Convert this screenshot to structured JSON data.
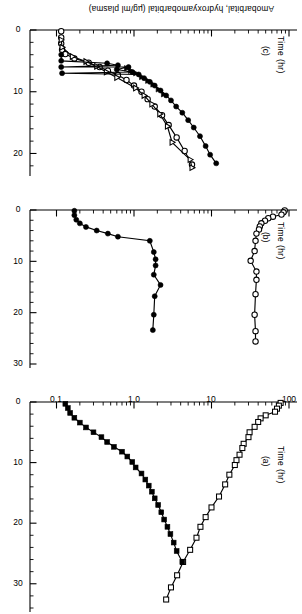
{
  "figure": {
    "orientation_deg": 180,
    "yaxis": {
      "label": "Amobarbital, hydroxyamobarbital (µg/ml plasma)",
      "scale": "log",
      "ticks": [
        "100",
        "10",
        "1.0",
        "0.1"
      ],
      "tick_values": [
        100,
        10,
        1,
        0.1
      ]
    },
    "panels": [
      {
        "id": "a",
        "panel_label": "(a)",
        "xlabel": "Time (hr)",
        "xticks": [
          "0",
          "10",
          "20",
          "30"
        ],
        "xtick_values": [
          0,
          10,
          20,
          30
        ],
        "xlim": [
          0,
          34
        ]
      },
      {
        "id": "b",
        "panel_label": "(b)",
        "xlabel": "Time (hr)",
        "xticks": [
          "0",
          "10",
          "20",
          "30"
        ],
        "xtick_values": [
          0,
          10,
          20,
          30
        ],
        "xlim": [
          0,
          30
        ]
      },
      {
        "id": "c",
        "panel_label": "(c)",
        "xlabel": "Time (hr)",
        "xticks": [
          "0",
          "10",
          "20"
        ],
        "xtick_values": [
          0,
          10,
          20
        ],
        "xlim": [
          0,
          23
        ]
      }
    ]
  },
  "chart_data": [
    {
      "type": "scatter",
      "panel": "a",
      "title": "(a)",
      "xlabel": "Time (hr)",
      "ylabel": "Amobarbital, hydroxyamobarbital (µg/ml plasma)",
      "yscale": "log",
      "xlim": [
        0,
        34
      ],
      "ylim": [
        0.1,
        100
      ],
      "grid": false,
      "series": [
        {
          "name": "amobarbital",
          "marker": "open-square",
          "points": [
            [
              0.15,
              78
            ],
            [
              0.6,
              74
            ],
            [
              1.1,
              70
            ],
            [
              1.6,
              66
            ],
            [
              2.2,
              50
            ],
            [
              2.7,
              43
            ],
            [
              3.3,
              40
            ],
            [
              4.1,
              36
            ],
            [
              5.0,
              31
            ],
            [
              5.8,
              30
            ],
            [
              6.9,
              26
            ],
            [
              7.6,
              25
            ],
            [
              8.7,
              23
            ],
            [
              9.6,
              21
            ],
            [
              10.4,
              20
            ],
            [
              12.0,
              17
            ],
            [
              13.6,
              15
            ],
            [
              15.6,
              12.5
            ],
            [
              17.4,
              10.0
            ],
            [
              19.0,
              8.4
            ],
            [
              20.6,
              7.2
            ],
            [
              22.4,
              6.4
            ],
            [
              24.4,
              5.3
            ],
            [
              26.4,
              4.3
            ],
            [
              28.6,
              3.6
            ],
            [
              30.6,
              3.0
            ],
            [
              32.6,
              2.6
            ]
          ]
        },
        {
          "name": "hydroxyamobarbital",
          "marker": "filled-square",
          "points": [
            [
              0.3,
              0.13
            ],
            [
              1.0,
              0.14
            ],
            [
              1.8,
              0.15
            ],
            [
              2.6,
              0.17
            ],
            [
              3.4,
              0.2
            ],
            [
              4.2,
              0.24
            ],
            [
              5.0,
              0.3
            ],
            [
              5.8,
              0.38
            ],
            [
              6.6,
              0.45
            ],
            [
              7.4,
              0.55
            ],
            [
              8.2,
              0.7
            ],
            [
              9.0,
              0.82
            ],
            [
              9.9,
              0.95
            ],
            [
              10.8,
              1.05
            ],
            [
              11.8,
              1.25
            ],
            [
              12.8,
              1.4
            ],
            [
              13.8,
              1.55
            ],
            [
              14.8,
              1.7
            ],
            [
              15.9,
              1.85
            ],
            [
              17.0,
              2.05
            ],
            [
              18.2,
              2.25
            ],
            [
              19.4,
              2.45
            ],
            [
              20.6,
              2.7
            ],
            [
              21.8,
              2.95
            ],
            [
              23.2,
              3.25
            ],
            [
              24.6,
              3.55
            ],
            [
              26.4,
              4.2
            ]
          ]
        }
      ]
    },
    {
      "type": "scatter",
      "panel": "b",
      "title": "(b)",
      "xlabel": "Time (hr)",
      "ylabel": "Amobarbital, hydroxyamobarbital (µg/ml plasma)",
      "yscale": "log",
      "xlim": [
        0,
        30
      ],
      "ylim": [
        0.1,
        100
      ],
      "grid": false,
      "series": [
        {
          "name": "amobarbital",
          "marker": "open-circle",
          "points": [
            [
              0.1,
              88
            ],
            [
              0.45,
              85
            ],
            [
              0.9,
              80
            ],
            [
              1.3,
              62
            ],
            [
              1.6,
              54
            ],
            [
              2.1,
              49
            ],
            [
              2.6,
              44
            ],
            [
              3.2,
              42
            ],
            [
              3.8,
              41
            ],
            [
              4.6,
              38
            ],
            [
              6.0,
              37
            ],
            [
              8.0,
              36
            ],
            [
              9.9,
              32
            ],
            [
              12.0,
              38
            ],
            [
              13.6,
              38
            ],
            [
              16.4,
              37
            ],
            [
              20.4,
              36
            ],
            [
              23.6,
              37
            ],
            [
              25.6,
              37
            ]
          ]
        },
        {
          "name": "hydroxyamobarbital",
          "marker": "filled-circle",
          "points": [
            [
              0.15,
              0.17
            ],
            [
              1.0,
              0.17
            ],
            [
              1.9,
              0.18
            ],
            [
              2.6,
              0.2
            ],
            [
              3.3,
              0.24
            ],
            [
              4.0,
              0.33
            ],
            [
              4.6,
              0.46
            ],
            [
              5.2,
              0.62
            ],
            [
              6.0,
              1.6
            ],
            [
              8.2,
              1.8
            ],
            [
              9.6,
              1.9
            ],
            [
              10.8,
              1.9
            ],
            [
              12.6,
              1.8
            ],
            [
              14.6,
              2.2
            ],
            [
              16.8,
              1.85
            ],
            [
              20.4,
              1.8
            ],
            [
              23.4,
              1.75
            ]
          ]
        }
      ]
    },
    {
      "type": "scatter",
      "panel": "c",
      "title": "(c)",
      "xlabel": "Time (hr)",
      "ylabel": "Amobarbital, hydroxyamobarbital (µg/ml plasma)",
      "yscale": "log",
      "xlim": [
        0,
        23
      ],
      "ylim": [
        0.1,
        100
      ],
      "grid": false,
      "series": [
        {
          "name": "amobarbital-open-circle",
          "marker": "open-circle",
          "points": [
            [
              0.2,
              0.115
            ],
            [
              1.2,
              0.115
            ],
            [
              2.2,
              0.115
            ],
            [
              3.2,
              0.118
            ],
            [
              3.9,
              0.13
            ],
            [
              4.6,
              0.17
            ],
            [
              5.3,
              0.26
            ],
            [
              6.0,
              0.36
            ],
            [
              6.6,
              0.46
            ],
            [
              7.3,
              0.62
            ],
            [
              8.1,
              0.8
            ],
            [
              9.0,
              1.0
            ],
            [
              10.0,
              1.25
            ],
            [
              11.2,
              1.5
            ],
            [
              12.4,
              1.85
            ],
            [
              13.8,
              2.3
            ],
            [
              15.4,
              2.8
            ],
            [
              17.4,
              3.55
            ],
            [
              19.6,
              4.5
            ],
            [
              21.8,
              5.6
            ]
          ]
        },
        {
          "name": "amobarbital-open-triangle",
          "marker": "open-triangle",
          "points": [
            [
              1.6,
              0.115
            ],
            [
              2.8,
              0.118
            ],
            [
              4.3,
              0.16
            ],
            [
              5.1,
              0.24
            ],
            [
              5.9,
              0.33
            ],
            [
              6.8,
              0.44
            ],
            [
              7.7,
              0.6
            ],
            [
              9.4,
              1.05
            ],
            [
              10.6,
              1.35
            ],
            [
              12.0,
              1.7
            ],
            [
              13.6,
              2.15
            ],
            [
              15.6,
              2.7
            ],
            [
              18.2,
              3.1
            ],
            [
              21.0,
              5.3
            ],
            [
              22.3,
              5.6
            ]
          ]
        },
        {
          "name": "hydroxyamobarbital-filled-circle",
          "marker": "filled-circle",
          "points": [
            [
              4.0,
              0.115
            ],
            [
              5.0,
              0.115
            ],
            [
              6.0,
              0.115
            ],
            [
              7.0,
              0.118
            ],
            [
              5.4,
              0.45
            ],
            [
              5.7,
              0.62
            ],
            [
              6.0,
              0.85
            ],
            [
              6.4,
              0.6
            ],
            [
              6.8,
              0.95
            ],
            [
              7.2,
              1.15
            ],
            [
              7.8,
              1.35
            ],
            [
              8.4,
              1.6
            ],
            [
              9.0,
              1.85
            ],
            [
              9.8,
              2.2
            ],
            [
              10.6,
              2.6
            ],
            [
              11.4,
              3.0
            ],
            [
              12.4,
              3.5
            ],
            [
              13.4,
              4.2
            ],
            [
              14.6,
              5.0
            ],
            [
              15.8,
              5.9
            ],
            [
              17.2,
              7.1
            ],
            [
              18.8,
              8.4
            ],
            [
              20.2,
              9.6
            ],
            [
              21.6,
              11.5
            ]
          ]
        },
        {
          "name": "hydroxyamobarbital-filled-triangle",
          "marker": "filled-triangle",
          "points": [
            [
              6.2,
              0.8
            ],
            [
              6.6,
              0.9
            ],
            [
              7.0,
              1.05
            ],
            [
              7.6,
              1.25
            ],
            [
              8.2,
              1.5
            ],
            [
              8.8,
              1.75
            ],
            [
              9.6,
              2.05
            ],
            [
              10.4,
              2.4
            ]
          ]
        }
      ]
    }
  ]
}
